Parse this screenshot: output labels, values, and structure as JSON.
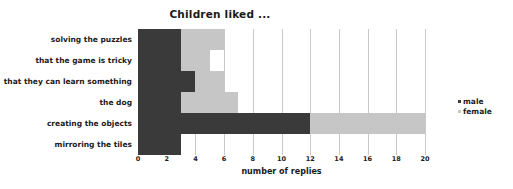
{
  "chart_data": {
    "type": "bar",
    "orientation": "horizontal",
    "stacked": true,
    "title": "Children liked ...",
    "xlabel": "number of replies",
    "ylabel": "",
    "xlim": [
      0,
      20
    ],
    "xticks": [
      0,
      2,
      4,
      6,
      8,
      10,
      12,
      14,
      16,
      18,
      20
    ],
    "xtick_labels": [
      "0",
      "2",
      "4",
      "6",
      "8",
      "10",
      "12",
      "14",
      "16",
      "18",
      "20"
    ],
    "grid": "vertical",
    "legend_position": "right",
    "categories": [
      "solving the puzzles",
      "that the game is tricky",
      "that they can learn something",
      "the dog",
      "creating the objects",
      "mirroring the tiles"
    ],
    "series": [
      {
        "name": "male",
        "color": "#3a3a3a",
        "values": [
          3,
          3,
          4,
          3,
          12,
          3
        ]
      },
      {
        "name": "female",
        "color": "#c6c6c6",
        "values": [
          3,
          2,
          2,
          4,
          8,
          0
        ]
      }
    ],
    "totals": [
      6,
      5,
      6,
      7,
      20,
      3
    ]
  },
  "legend": {
    "items": [
      {
        "label": "male",
        "color": "#3a3a3a"
      },
      {
        "label": "female",
        "color": "#c6c6c6"
      }
    ]
  }
}
